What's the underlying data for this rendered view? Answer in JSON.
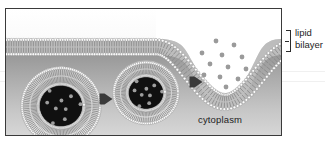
{
  "figure": {
    "title_alt": "Exocytosis: vesicle fusion with the plasma membrane",
    "frame": {
      "x": 5,
      "y": 8,
      "width": 277,
      "height": 128,
      "border_color": "#3a3a3a"
    }
  },
  "labels": {
    "cytoplasm": "cytoplasm",
    "lipid_bilayer_line1": "lipid",
    "lipid_bilayer_line2": "bilayer"
  },
  "colors": {
    "frame_border": "#3a3a3a",
    "text": "#1d1d1d",
    "extracellular_bg": "#ffffff",
    "cytoplasm_top": "#8e8e8e",
    "cytoplasm_bottom": "#d8d8d8",
    "lipid_head": "#fdfdfd",
    "lipid_head_stroke": "#8f8f8f",
    "lipid_tail": "#8a8a8a",
    "vesicle_lumen": "#101010",
    "cargo_dot": "#9e9e9e",
    "arrow": "#3a3a3a",
    "membrane_core": "#b8b8b8"
  },
  "membrane": {
    "name": "plasma-membrane-lipid-bilayer",
    "leaflets": 2,
    "head_count_per_leaflet": 96,
    "top_y": 30,
    "bottom_y": 46,
    "fusion_pore": {
      "present": true,
      "center_x": 215,
      "depth_y": 86,
      "description": "invaginated fusion pore releasing cargo to extracellular space"
    }
  },
  "vesicles": [
    {
      "name": "vesicle-left",
      "stage": "approaching",
      "cx": 55,
      "cy": 97,
      "rx": 39,
      "ry": 38,
      "lumen_rx": 23,
      "lumen_ry": 22,
      "cargo_dots": 9
    },
    {
      "name": "vesicle-middle",
      "stage": "docking",
      "cx": 140,
      "cy": 84,
      "rx": 32,
      "ry": 31,
      "lumen_rx": 19,
      "lumen_ry": 17,
      "cargo_dots": 9
    }
  ],
  "arrows": [
    {
      "name": "arrow-vesicle-transport-1",
      "x": 100,
      "y": 90,
      "direction": "right"
    },
    {
      "name": "arrow-vesicle-transport-2",
      "x": 190,
      "y": 73,
      "direction": "right"
    }
  ],
  "released_cargo": {
    "name": "released-cargo-dots",
    "count": 12,
    "radius": 2.4,
    "points": [
      [
        210,
        32
      ],
      [
        228,
        36
      ],
      [
        196,
        44
      ],
      [
        216,
        46
      ],
      [
        236,
        48
      ],
      [
        204,
        55
      ],
      [
        222,
        58
      ],
      [
        240,
        60
      ],
      [
        198,
        66
      ],
      [
        214,
        68
      ],
      [
        232,
        70
      ],
      [
        220,
        78
      ]
    ]
  }
}
